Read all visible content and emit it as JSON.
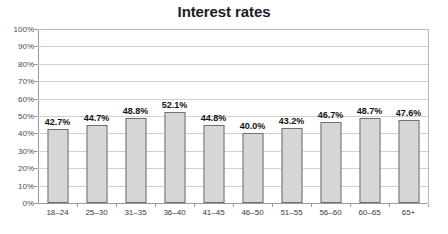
{
  "chart_data": {
    "type": "bar",
    "title": "Interest rates",
    "xlabel": "",
    "ylabel": "",
    "categories": [
      "18–24",
      "25–30",
      "31–35",
      "36–40",
      "41–45",
      "46–50",
      "51–55",
      "56–60",
      "60–65",
      "65+"
    ],
    "values": [
      42.7,
      44.7,
      48.8,
      52.1,
      44.8,
      40.0,
      43.2,
      46.7,
      48.7,
      47.6
    ],
    "data_labels": [
      "42.7%",
      "44.7%",
      "48.8%",
      "52.1%",
      "44.8%",
      "40.0%",
      "43.2%",
      "46.7%",
      "48.7%",
      "47.6%"
    ],
    "ylim": [
      0,
      100
    ],
    "ytick_values": [
      0,
      10,
      20,
      30,
      40,
      50,
      60,
      70,
      80,
      90,
      100
    ],
    "ytick_labels": [
      "0%",
      "10%",
      "20%",
      "30%",
      "40%",
      "50%",
      "60%",
      "70%",
      "80%",
      "90%",
      "100%"
    ],
    "grid": true,
    "grid_axis": "y",
    "legend": false,
    "legend_position": "none",
    "bar_fill_color": "#d6d6d6",
    "bar_border_color": "#6f6f6f",
    "gridline_color": "#cfcfcf",
    "axis_color": "#9a9a9a",
    "title_color": "#1d1d1d",
    "data_label_color": "#111111",
    "tick_label_color": "#4a4a4a",
    "background_color": "#ffffff"
  }
}
